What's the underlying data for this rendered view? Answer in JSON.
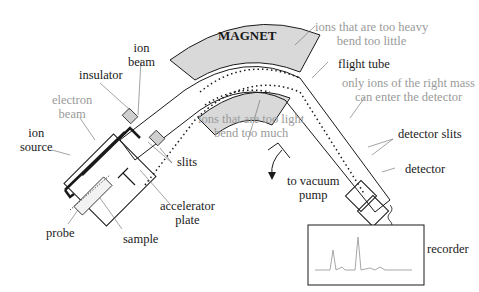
{
  "diagram": {
    "magnet_label": "MAGNET",
    "labels": {
      "ion_beam": [
        "ion",
        "beam"
      ],
      "insulator": "insulator",
      "electron_beam": [
        "electron",
        "beam"
      ],
      "ion_source": [
        "ion",
        "source"
      ],
      "slits": "slits",
      "accelerator_plate": [
        "accelerator",
        "plate"
      ],
      "probe": "probe",
      "sample": "sample",
      "too_heavy": [
        "ions that are too heavy",
        "bend too little"
      ],
      "too_light": [
        "ions that are too light",
        "bend too much"
      ],
      "flight_tube": "flight tube",
      "right_mass": [
        "only ions of the right mass",
        "can enter the detector"
      ],
      "detector_slits": "detector slits",
      "detector": "detector",
      "vacuum_pump": [
        "to vacuum",
        "pump"
      ],
      "recorder": "recorder"
    },
    "colors": {
      "line": "#1a1a1a",
      "magnet_fill": "#d9d9d9",
      "grey_text": "#9a9a9a",
      "spectrum": "#a8a8a8"
    }
  }
}
